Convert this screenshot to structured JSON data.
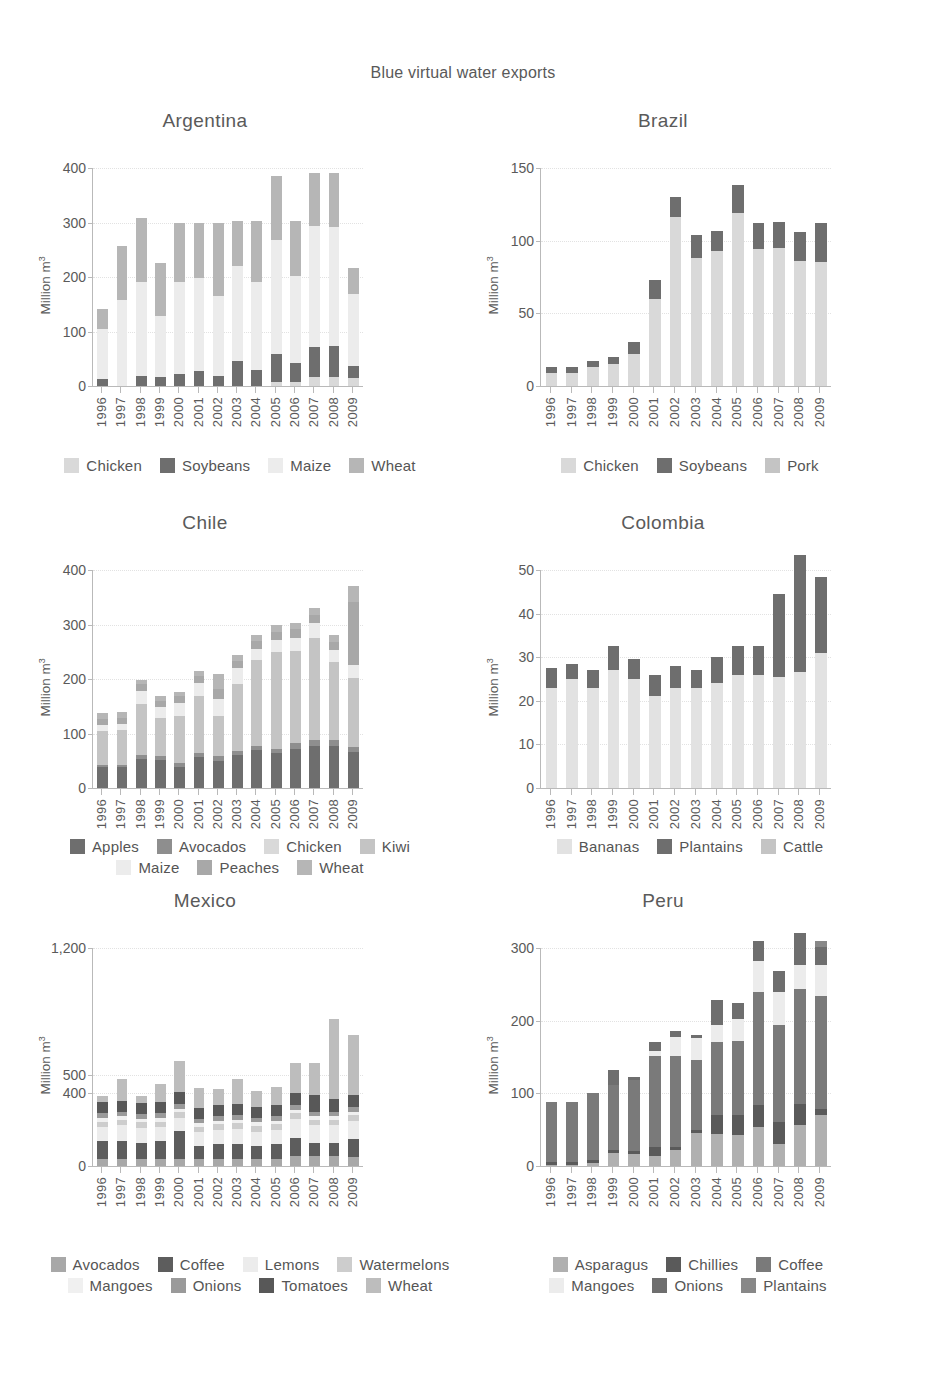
{
  "figure": {
    "suptitle": "Blue virtual water exports",
    "ylabel": "Million m",
    "ylabel_sup": "3",
    "years": [
      "1996",
      "1997",
      "1998",
      "1999",
      "2000",
      "2001",
      "2002",
      "2003",
      "2004",
      "2005",
      "2006",
      "2007",
      "2008",
      "2009"
    ]
  },
  "palette": {
    "very_light": "#ececec",
    "light": "#d9d9d9",
    "mid_light": "#c4c4c4",
    "mid": "#a8a8a8",
    "mid_dark": "#8e8e8e",
    "dark": "#6e6e6e",
    "very_dark": "#595959",
    "darkest": "#4a4a4a"
  },
  "chart_data": [
    {
      "type": "bar",
      "title": "Argentina",
      "stacked": true,
      "xlabel": "",
      "ylabel": "Million m3",
      "ylim": [
        0,
        400
      ],
      "yticks": [
        0,
        100,
        200,
        300,
        400
      ],
      "ytick_labels": [
        "0",
        "100",
        "200",
        "300",
        "400"
      ],
      "grid": true,
      "legend_position": "bottom",
      "categories": [
        "1996",
        "1997",
        "1998",
        "1999",
        "2000",
        "2001",
        "2002",
        "2003",
        "2004",
        "2005",
        "2006",
        "2007",
        "2008",
        "2009"
      ],
      "series": [
        {
          "name": "Chicken",
          "color": "#d9d9d9",
          "values": [
            0,
            0,
            0,
            0,
            0,
            0,
            0,
            0,
            0,
            8,
            8,
            16,
            16,
            14
          ]
        },
        {
          "name": "Soybeans",
          "color": "#6e6e6e",
          "values": [
            12,
            0,
            18,
            16,
            22,
            28,
            18,
            45,
            30,
            50,
            35,
            55,
            58,
            22
          ]
        },
        {
          "name": "Maize",
          "color": "#ececec",
          "values": [
            92,
            157,
            172,
            112,
            168,
            170,
            148,
            175,
            160,
            210,
            158,
            222,
            218,
            132
          ]
        },
        {
          "name": "Wheat",
          "color": "#b6b6b6",
          "values": [
            38,
            100,
            118,
            98,
            110,
            102,
            134,
            82,
            112,
            118,
            102,
            98,
            98,
            48
          ]
        }
      ]
    },
    {
      "type": "bar",
      "title": "Brazil",
      "stacked": true,
      "xlabel": "",
      "ylabel": "Million m3",
      "ylim": [
        0,
        150
      ],
      "yticks": [
        0,
        50,
        100,
        150
      ],
      "ytick_labels": [
        "0",
        "50",
        "100",
        "150"
      ],
      "grid": true,
      "legend_position": "bottom",
      "categories": [
        "1996",
        "1997",
        "1998",
        "1999",
        "2000",
        "2001",
        "2002",
        "2003",
        "2004",
        "2005",
        "2006",
        "2007",
        "2008",
        "2009"
      ],
      "series": [
        {
          "name": "Chicken",
          "color": "#d9d9d9",
          "values": [
            9,
            9,
            13,
            15,
            22,
            60,
            116,
            88,
            93,
            119,
            94,
            95,
            86,
            85
          ]
        },
        {
          "name": "Soybeans",
          "color": "#6e6e6e",
          "values": [
            4,
            4,
            4,
            5,
            8,
            13,
            14,
            16,
            14,
            19,
            18,
            18,
            20,
            27
          ]
        },
        {
          "name": "Pork",
          "color": "#c4c4c4",
          "values": [
            0,
            0,
            0,
            0,
            0,
            0,
            0,
            0,
            0,
            0,
            0,
            0,
            0,
            0
          ]
        }
      ]
    },
    {
      "type": "bar",
      "title": "Chile",
      "stacked": true,
      "xlabel": "",
      "ylabel": "Million m3",
      "ylim": [
        0,
        400
      ],
      "yticks": [
        0,
        100,
        200,
        300,
        400
      ],
      "ytick_labels": [
        "0",
        "100",
        "200",
        "300",
        "400"
      ],
      "grid": true,
      "legend_position": "bottom",
      "categories": [
        "1996",
        "1997",
        "1998",
        "1999",
        "2000",
        "2001",
        "2002",
        "2003",
        "2004",
        "2005",
        "2006",
        "2007",
        "2008",
        "2009"
      ],
      "series": [
        {
          "name": "Apples",
          "color": "#6e6e6e",
          "values": [
            38,
            38,
            54,
            52,
            38,
            56,
            50,
            60,
            70,
            64,
            72,
            78,
            78,
            66
          ]
        },
        {
          "name": "Avocados",
          "color": "#8e8e8e",
          "values": [
            4,
            4,
            6,
            6,
            8,
            8,
            8,
            8,
            8,
            8,
            10,
            10,
            10,
            10
          ]
        },
        {
          "name": "Chicken",
          "color": "#d9d9d9",
          "values": [
            0,
            0,
            0,
            0,
            0,
            0,
            0,
            0,
            0,
            0,
            0,
            0,
            0,
            0
          ]
        },
        {
          "name": "Kiwi",
          "color": "#c4c4c4",
          "values": [
            62,
            64,
            94,
            70,
            86,
            104,
            74,
            122,
            156,
            178,
            170,
            188,
            144,
            126
          ]
        },
        {
          "name": "Maize",
          "color": "#ececec",
          "values": [
            12,
            12,
            24,
            20,
            24,
            24,
            32,
            30,
            22,
            22,
            24,
            26,
            22,
            24
          ]
        },
        {
          "name": "Peaches",
          "color": "#a8a8a8",
          "values": [
            10,
            10,
            12,
            12,
            12,
            14,
            18,
            14,
            14,
            14,
            16,
            16,
            14,
            116
          ]
        },
        {
          "name": "Wheat",
          "color": "#b6b6b6",
          "values": [
            11,
            12,
            9,
            9,
            9,
            9,
            28,
            10,
            10,
            14,
            10,
            12,
            12,
            28
          ]
        }
      ]
    },
    {
      "type": "bar",
      "title": "Colombia",
      "stacked": true,
      "xlabel": "",
      "ylabel": "Million m3",
      "ylim": [
        0,
        50
      ],
      "yticks": [
        0,
        10,
        20,
        30,
        40,
        50
      ],
      "ytick_labels": [
        "0",
        "10",
        "20",
        "30",
        "40",
        "50"
      ],
      "grid": true,
      "legend_position": "bottom",
      "categories": [
        "1996",
        "1997",
        "1998",
        "1999",
        "2000",
        "2001",
        "2002",
        "2003",
        "2004",
        "2005",
        "2006",
        "2007",
        "2008",
        "2009"
      ],
      "series": [
        {
          "name": "Bananas",
          "color": "#e2e2e2",
          "values": [
            23,
            25,
            23,
            27,
            25,
            21,
            23,
            23,
            24,
            26,
            26,
            25.5,
            26.5,
            31
          ]
        },
        {
          "name": "Plantains",
          "color": "#6e6e6e",
          "values": [
            4.5,
            3.5,
            4,
            5.5,
            4.5,
            5,
            5,
            4,
            6,
            6.5,
            6.5,
            19,
            27,
            17.5
          ]
        },
        {
          "name": "Cattle",
          "color": "#c4c4c4",
          "values": [
            0,
            0,
            0,
            0,
            0,
            0,
            0,
            0,
            0,
            0,
            0,
            0,
            0,
            0
          ]
        }
      ]
    },
    {
      "type": "bar",
      "title": "Mexico",
      "stacked": true,
      "xlabel": "",
      "ylabel": "Million m3",
      "ylim": [
        0,
        1200
      ],
      "yticks": [
        0,
        400,
        500,
        1200
      ],
      "ytick_labels": [
        "0",
        "400",
        "500",
        "1,200"
      ],
      "grid": true,
      "legend_position": "bottom",
      "categories": [
        "1996",
        "1997",
        "1998",
        "1999",
        "2000",
        "2001",
        "2002",
        "2003",
        "2004",
        "2005",
        "2006",
        "2007",
        "2008",
        "2009"
      ],
      "series": [
        {
          "name": "Avocados",
          "color": "#a8a8a8",
          "values": [
            40,
            40,
            40,
            40,
            40,
            40,
            40,
            40,
            40,
            40,
            55,
            55,
            55,
            50
          ]
        },
        {
          "name": "Coffee",
          "color": "#5d5d5d",
          "values": [
            95,
            100,
            85,
            95,
            150,
            70,
            80,
            80,
            70,
            80,
            100,
            70,
            70,
            100
          ]
        },
        {
          "name": "Lemons",
          "color": "#ececec",
          "values": [
            80,
            85,
            85,
            80,
            75,
            75,
            80,
            85,
            80,
            80,
            105,
            100,
            100,
            100
          ]
        },
        {
          "name": "Watermelons",
          "color": "#cdcdcd",
          "values": [
            30,
            30,
            30,
            30,
            30,
            30,
            30,
            30,
            30,
            30,
            30,
            30,
            30,
            30
          ]
        },
        {
          "name": "Mangoes",
          "color": "#f0f0f0",
          "values": [
            20,
            20,
            20,
            20,
            20,
            20,
            20,
            20,
            20,
            20,
            20,
            20,
            20,
            20
          ]
        },
        {
          "name": "Onions",
          "color": "#9a9a9a",
          "values": [
            25,
            25,
            25,
            25,
            25,
            25,
            25,
            25,
            25,
            25,
            25,
            25,
            25,
            25
          ]
        },
        {
          "name": "Tomatoes",
          "color": "#585858",
          "values": [
            60,
            60,
            60,
            60,
            70,
            60,
            60,
            60,
            60,
            60,
            70,
            90,
            70,
            65
          ]
        },
        {
          "name": "Wheat",
          "color": "#bdbdbd",
          "values": [
            35,
            120,
            40,
            100,
            170,
            110,
            90,
            140,
            90,
            100,
            160,
            180,
            440,
            330
          ]
        }
      ]
    },
    {
      "type": "bar",
      "title": "Peru",
      "stacked": true,
      "xlabel": "",
      "ylabel": "Million m3",
      "ylim": [
        0,
        300
      ],
      "yticks": [
        0,
        100,
        200,
        300
      ],
      "ytick_labels": [
        "0",
        "100",
        "200",
        "300"
      ],
      "grid": true,
      "legend_position": "bottom",
      "categories": [
        "1996",
        "1997",
        "1998",
        "1999",
        "2000",
        "2001",
        "2002",
        "2003",
        "2004",
        "2005",
        "2006",
        "2007",
        "2008",
        "2009"
      ],
      "series": [
        {
          "name": "Asparagus",
          "color": "#b0b0b0",
          "values": [
            2,
            2,
            4,
            18,
            16,
            14,
            22,
            46,
            44,
            42,
            54,
            30,
            56,
            70
          ]
        },
        {
          "name": "Chillies",
          "color": "#5a5a5a",
          "values": [
            4,
            4,
            4,
            4,
            4,
            12,
            4,
            4,
            26,
            28,
            30,
            30,
            30,
            8
          ]
        },
        {
          "name": "Coffee",
          "color": "#7a7a7a",
          "values": [
            82,
            82,
            92,
            90,
            98,
            126,
            126,
            96,
            100,
            102,
            156,
            134,
            158,
            156
          ]
        },
        {
          "name": "Mangoes",
          "color": "#ececec",
          "values": [
            0,
            0,
            0,
            0,
            0,
            6,
            26,
            30,
            24,
            30,
            42,
            46,
            32,
            42
          ]
        },
        {
          "name": "Onions",
          "color": "#6e6e6e",
          "values": [
            0,
            0,
            0,
            20,
            4,
            12,
            8,
            4,
            34,
            22,
            28,
            28,
            44,
            26
          ]
        },
        {
          "name": "Plantains",
          "color": "#888888",
          "values": [
            0,
            0,
            0,
            0,
            0,
            0,
            0,
            0,
            0,
            0,
            0,
            0,
            0,
            8
          ]
        }
      ]
    }
  ]
}
